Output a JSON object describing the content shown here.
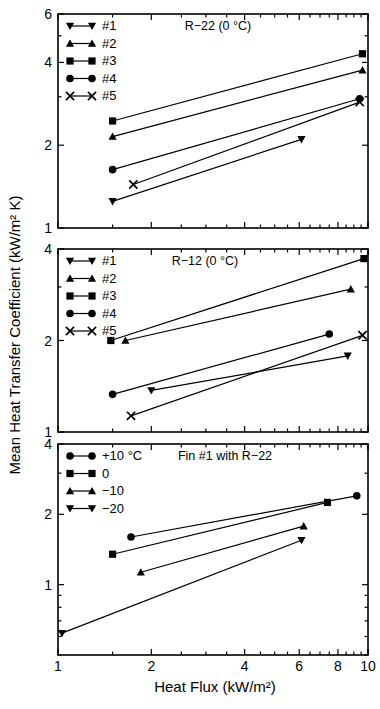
{
  "figure": {
    "xlabel": "Heat Flux (kW/m²)",
    "ylabel": "Mean Heat Transfer Coefficient (kW/m² K)",
    "line_color": "#000000",
    "background": "#ffffff"
  },
  "axes": {
    "x_ticks": [
      "1",
      "2",
      "4",
      "6",
      "8",
      "10"
    ],
    "x_tick_values": [
      1,
      2,
      4,
      6,
      8,
      10
    ],
    "x_range": [
      1,
      10
    ],
    "x_scale": "log",
    "panel_a_y_ticks": [
      "1",
      "2",
      "4",
      "6"
    ],
    "panel_a_y_tick_values": [
      1,
      2,
      4,
      6
    ],
    "panel_a_y_range": [
      1,
      6
    ],
    "panel_b_y_ticks": [
      "1",
      "2",
      "4"
    ],
    "panel_b_y_tick_values": [
      1,
      2,
      4
    ],
    "panel_b_y_range": [
      1,
      4
    ],
    "panel_c_y_ticks": [
      "1",
      "2",
      "4"
    ],
    "panel_c_y_tick_values": [
      1,
      2,
      4
    ],
    "panel_c_y_range": [
      0.5,
      4
    ],
    "y_scale": "log",
    "grid": false
  },
  "chart_data": [
    {
      "type": "line",
      "panel": "top",
      "title": "R−22 (0 °C)",
      "xlabel": "",
      "ylabel": "Mean Heat Transfer Coefficient (kW/m² K)",
      "xlim": [
        1,
        10
      ],
      "ylim": [
        1,
        6
      ],
      "xscale": "log",
      "yscale": "log",
      "grid": false,
      "legend_position": "top-left",
      "series": [
        {
          "name": "#1",
          "marker": "triangle-down",
          "x": [
            1.5,
            6.1
          ],
          "y": [
            1.25,
            2.1
          ]
        },
        {
          "name": "#2",
          "marker": "triangle-up",
          "x": [
            1.5,
            9.6
          ],
          "y": [
            2.15,
            3.75
          ]
        },
        {
          "name": "#3",
          "marker": "square",
          "x": [
            1.5,
            9.6
          ],
          "y": [
            2.45,
            4.3
          ]
        },
        {
          "name": "#4",
          "marker": "circle",
          "x": [
            1.5,
            9.4
          ],
          "y": [
            1.63,
            2.95
          ]
        },
        {
          "name": "#5",
          "marker": "cross",
          "x": [
            1.75,
            9.4
          ],
          "y": [
            1.44,
            2.87
          ]
        }
      ]
    },
    {
      "type": "line",
      "panel": "middle",
      "title": "R−12 (0 °C)",
      "xlabel": "",
      "ylabel": "Mean Heat Transfer Coefficient (kW/m² K)",
      "xlim": [
        1,
        10
      ],
      "ylim": [
        1,
        4
      ],
      "xscale": "log",
      "yscale": "log",
      "grid": false,
      "legend_position": "top-left",
      "series": [
        {
          "name": "#1",
          "marker": "triangle-down",
          "x": [
            2.0,
            8.6
          ],
          "y": [
            1.37,
            1.78
          ]
        },
        {
          "name": "#2",
          "marker": "triangle-up",
          "x": [
            1.65,
            8.8
          ],
          "y": [
            2.0,
            2.95
          ]
        },
        {
          "name": "#3",
          "marker": "square",
          "x": [
            1.48,
            9.7
          ],
          "y": [
            2.0,
            3.72
          ]
        },
        {
          "name": "#4",
          "marker": "circle",
          "x": [
            1.5,
            7.5
          ],
          "y": [
            1.33,
            2.1
          ]
        },
        {
          "name": "#5",
          "marker": "cross",
          "x": [
            1.72,
            9.6
          ],
          "y": [
            1.13,
            2.08
          ]
        }
      ]
    },
    {
      "type": "line",
      "panel": "bottom",
      "title": "Fin #1 with R−22",
      "xlabel": "Heat Flux (kW/m²)",
      "ylabel": "Mean Heat Transfer Coefficient (kW/m² K)",
      "xlim": [
        1,
        10
      ],
      "ylim": [
        0.5,
        4
      ],
      "xscale": "log",
      "yscale": "log",
      "grid": false,
      "legend_position": "top-left",
      "series": [
        {
          "name": "+10 °C",
          "marker": "circle",
          "x": [
            1.72,
            9.2
          ],
          "y": [
            1.6,
            2.4
          ]
        },
        {
          "name": "0",
          "marker": "square",
          "x": [
            1.5,
            7.4
          ],
          "y": [
            1.35,
            2.25
          ]
        },
        {
          "name": "−10",
          "marker": "triangle-up",
          "x": [
            1.85,
            6.2
          ],
          "y": [
            1.13,
            1.78
          ]
        },
        {
          "name": "−20",
          "marker": "triangle-down",
          "x": [
            1.03,
            6.1
          ],
          "y": [
            0.62,
            1.55
          ]
        }
      ]
    }
  ],
  "legends": {
    "top": [
      {
        "label": "#1",
        "marker": "triangle-down"
      },
      {
        "label": "#2",
        "marker": "triangle-up"
      },
      {
        "label": "#3",
        "marker": "square"
      },
      {
        "label": "#4",
        "marker": "circle"
      },
      {
        "label": "#5",
        "marker": "cross"
      }
    ],
    "middle": [
      {
        "label": "#1",
        "marker": "triangle-down"
      },
      {
        "label": "#2",
        "marker": "triangle-up"
      },
      {
        "label": "#3",
        "marker": "square"
      },
      {
        "label": "#4",
        "marker": "circle"
      },
      {
        "label": "#5",
        "marker": "cross"
      }
    ],
    "bottom": [
      {
        "label": "+10 °C",
        "marker": "circle"
      },
      {
        "label": "0",
        "marker": "square"
      },
      {
        "label": "−10",
        "marker": "triangle-up"
      },
      {
        "label": "−20",
        "marker": "triangle-down"
      }
    ]
  }
}
